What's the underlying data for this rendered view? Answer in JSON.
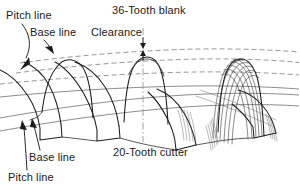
{
  "figure": {
    "kind": "gear-tooth-generation-diagram",
    "background_color": "#ffffff",
    "line_color": "#1c1c1c",
    "reference_line_color": "#7d7d7d",
    "text_color": "#1a1a1a"
  },
  "labels": {
    "title_top": "36-Tooth blank",
    "title_bottom": "20-Tooth cutter",
    "pitch_line_top": "Pitch line",
    "base_line_top": "Base line",
    "clearance": "Clearance",
    "base_line_bottom": "Base line",
    "pitch_line_bottom": "Pitch line"
  },
  "annotations": [
    {
      "name": "pitch-line-top",
      "text": "Pitch line",
      "x": 6,
      "y": 18,
      "leader": "curve from label down-left to pitch reference line"
    },
    {
      "name": "base-line-top",
      "text": "Base line",
      "x": 30,
      "y": 35,
      "leader": "short diagonal to base reference line"
    },
    {
      "name": "clearance",
      "text": "Clearance",
      "x": 92,
      "y": 35,
      "leader": "vertical double arrow between blank tip and cutter root"
    },
    {
      "name": "title-top",
      "text": "36-Tooth blank",
      "x": 112,
      "y": 13
    },
    {
      "name": "title-bottom",
      "text": "20-Tooth cutter",
      "x": 112,
      "y": 155
    },
    {
      "name": "base-line-bottom",
      "text": "Base line",
      "x": 28,
      "y": 160,
      "leader": "diagonal up-left to lower base line"
    },
    {
      "name": "pitch-line-bottom",
      "text": "Pitch line",
      "x": 8,
      "y": 180,
      "leader": "diagonal up to lower pitch line"
    }
  ],
  "reference_lines": [
    {
      "name": "upper-pitch-line",
      "style": "dashed",
      "role": "pitch line of blank"
    },
    {
      "name": "upper-base-line",
      "style": "dashed",
      "role": "base line of blank"
    },
    {
      "name": "lower-pitch-line",
      "style": "solid-thin",
      "role": "pitch line of cutter"
    },
    {
      "name": "lower-base-line",
      "style": "solid-thin",
      "role": "base line of cutter"
    },
    {
      "name": "tooth-centerline",
      "style": "dash-dot",
      "role": "center line of middle tooth"
    }
  ],
  "features": {
    "blank_teeth_count_visible": 3,
    "cutter_teeth_count_visible": 3,
    "envelope_traces": "dense family of cutter outlines generating the right-hand tooth flank"
  }
}
